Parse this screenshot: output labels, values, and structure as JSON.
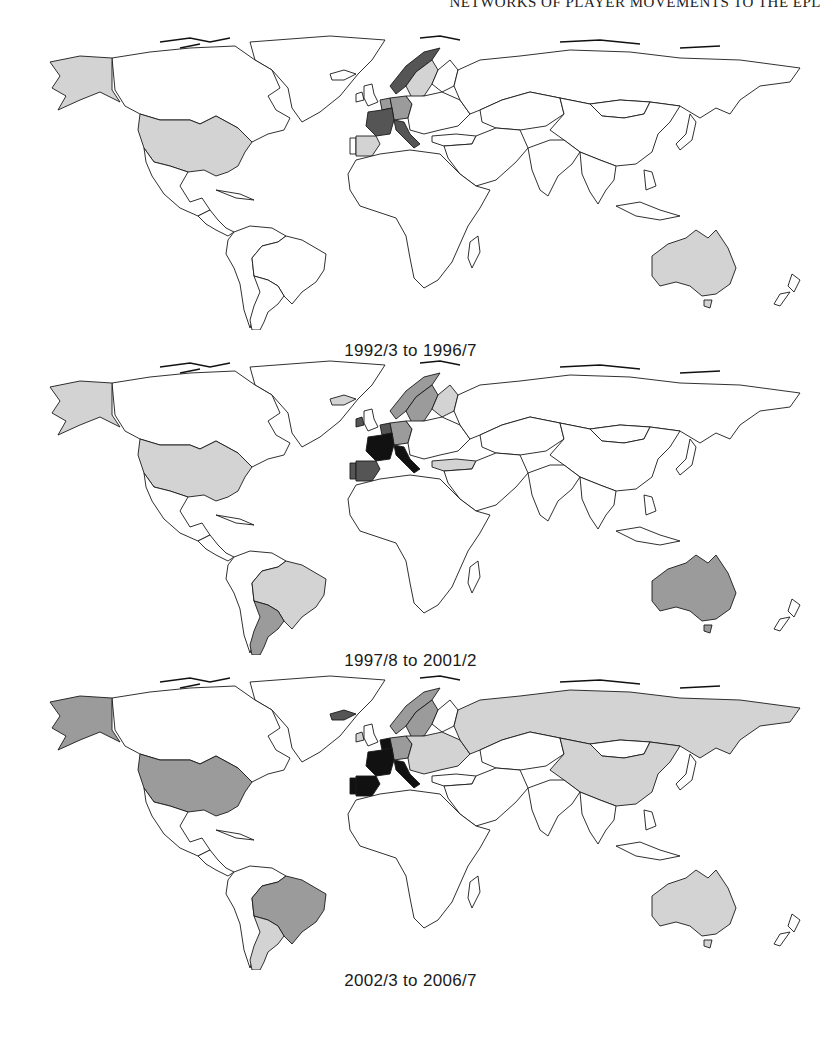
{
  "page": {
    "running_head": "NETWORKS OF PLAYER MOVEMENTS TO THE EPL"
  },
  "legend_shades": {
    "none": "#ffffff",
    "light": "#d3d3d3",
    "medium": "#9b9b9b",
    "dark": "#555555",
    "black": "#111111"
  },
  "maps": [
    {
      "caption": "1992/3 to 1996/7",
      "countries": {
        "alaska": "light",
        "usa": "light",
        "canada": "none",
        "greenland": "none",
        "mexico": "none",
        "central_america": "none",
        "brazil": "none",
        "argentina": "none",
        "south_america_other": "none",
        "uk": "none",
        "ireland": "none",
        "iceland": "none",
        "france": "dark",
        "spain": "light",
        "portugal": "none",
        "italy": "dark",
        "germany": "medium",
        "netherlands": "medium",
        "scandinavia_west": "dark",
        "sweden": "light",
        "finland": "none",
        "eastern_europe": "none",
        "turkey": "none",
        "russia": "none",
        "china": "none",
        "mongolia": "none",
        "kazakhstan": "none",
        "middle_east": "none",
        "india": "none",
        "southeast_asia": "none",
        "japan": "none",
        "africa": "none",
        "madagascar": "none",
        "australia": "light",
        "new_zealand": "none"
      }
    },
    {
      "caption": "1997/8 to 2001/2",
      "countries": {
        "alaska": "light",
        "usa": "light",
        "canada": "none",
        "greenland": "none",
        "mexico": "none",
        "central_america": "none",
        "brazil": "light",
        "argentina": "medium",
        "south_america_other": "none",
        "uk": "none",
        "ireland": "dark",
        "iceland": "light",
        "france": "black",
        "spain": "dark",
        "portugal": "dark",
        "italy": "black",
        "germany": "medium",
        "netherlands": "dark",
        "scandinavia_west": "medium",
        "sweden": "medium",
        "finland": "light",
        "eastern_europe": "none",
        "turkey": "light",
        "russia": "none",
        "china": "none",
        "mongolia": "none",
        "kazakhstan": "none",
        "middle_east": "none",
        "india": "none",
        "southeast_asia": "none",
        "japan": "none",
        "africa": "none",
        "madagascar": "none",
        "australia": "medium",
        "new_zealand": "none"
      }
    },
    {
      "caption": "2002/3 to 2006/7",
      "countries": {
        "alaska": "medium",
        "usa": "medium",
        "canada": "none",
        "greenland": "none",
        "mexico": "none",
        "central_america": "none",
        "brazil": "medium",
        "argentina": "light",
        "south_america_other": "none",
        "uk": "none",
        "ireland": "light",
        "iceland": "dark",
        "france": "black",
        "spain": "black",
        "portugal": "black",
        "italy": "black",
        "germany": "medium",
        "netherlands": "black",
        "scandinavia_west": "medium",
        "sweden": "medium",
        "finland": "none",
        "eastern_europe": "light",
        "turkey": "none",
        "russia": "light",
        "china": "light",
        "mongolia": "none",
        "kazakhstan": "none",
        "middle_east": "none",
        "india": "none",
        "southeast_asia": "none",
        "japan": "none",
        "africa": "none",
        "madagascar": "none",
        "australia": "light",
        "new_zealand": "none"
      }
    }
  ]
}
